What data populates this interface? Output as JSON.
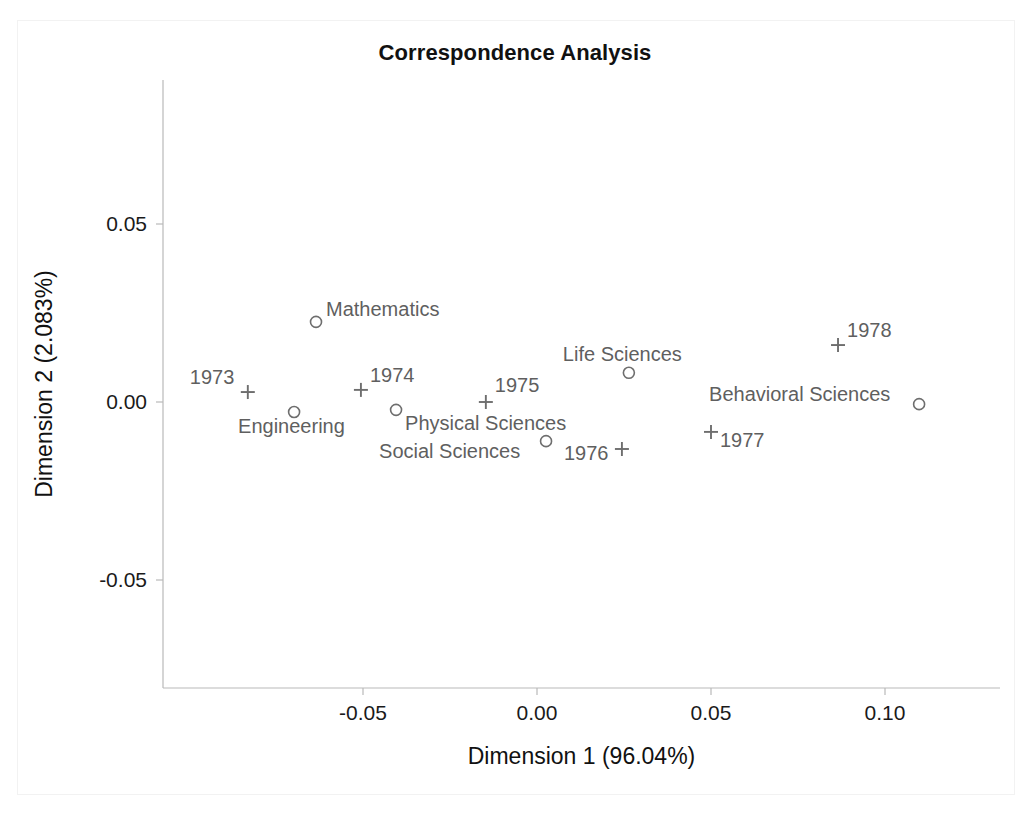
{
  "chart_data": {
    "type": "scatter",
    "title": "Correspondence Analysis",
    "xlabel": "Dimension 1 (96.04%)",
    "ylabel": "Dimension 2 (2.083%)",
    "xlim": [
      -0.092,
      0.125
    ],
    "ylim": [
      -0.072,
      0.058
    ],
    "xticks": [
      -0.05,
      0.0,
      0.05,
      0.1
    ],
    "xtick_labels": [
      "-0.05",
      "0.00",
      "0.05",
      "0.10"
    ],
    "yticks": [
      0.05,
      0.0,
      -0.05
    ],
    "ytick_labels": [
      "0.05",
      "0.00",
      "-0.05"
    ],
    "grid": false,
    "legend": "none",
    "marker_color": "#6e6e6e",
    "label_color": "#5f5f5f",
    "axis_color": "#b9b9b9",
    "series": [
      {
        "name": "Field of study",
        "marker": "circle",
        "points": [
          {
            "label": "Mathematics",
            "x": -0.0635,
            "y": 0.0225,
            "label_dx": 10,
            "label_dy": -6
          },
          {
            "label": "Engineering",
            "x": -0.0698,
            "y": -0.0028,
            "label_dx": -56,
            "label_dy": 21
          },
          {
            "label": "Physical Sciences",
            "x": -0.0405,
            "y": -0.0022,
            "label_dx": 9,
            "label_dy": 20
          },
          {
            "label": "Social Sciences",
            "x": 0.0026,
            "y": -0.011,
            "label_dx": -167,
            "label_dy": 17
          },
          {
            "label": "Life Sciences",
            "x": 0.0264,
            "y": 0.0082,
            "label_dx": -66,
            "label_dy": -12
          },
          {
            "label": "Behavioral Sciences",
            "x": 0.1098,
            "y": -0.0006,
            "label_dx": -210,
            "label_dy": -3
          }
        ]
      },
      {
        "name": "Year",
        "marker": "plus",
        "points": [
          {
            "label": "1973",
            "x": -0.0831,
            "y": 0.0028,
            "label_dx": -58,
            "label_dy": -8
          },
          {
            "label": "1974",
            "x": -0.0506,
            "y": 0.0034,
            "label_dx": 9,
            "label_dy": -8
          },
          {
            "label": "1975",
            "x": -0.0147,
            "y": 0.0,
            "label_dx": 9,
            "label_dy": -10
          },
          {
            "label": "1976",
            "x": 0.0244,
            "y": -0.0132,
            "label_dx": -58,
            "label_dy": 11
          },
          {
            "label": "1977",
            "x": 0.05,
            "y": -0.0084,
            "label_dx": 9,
            "label_dy": 15
          },
          {
            "label": "1978",
            "x": 0.0865,
            "y": 0.016,
            "label_dx": 9,
            "label_dy": -8
          }
        ]
      }
    ]
  },
  "axes_geometry": {
    "x_origin_px": 537,
    "y_origin_px": 402,
    "x_scale_px_per_unit": 3480,
    "y_scale_px_per_unit": 3560,
    "axis_left_px": 163,
    "axis_right_px": 1000,
    "axis_top_px": 80,
    "axis_bottom_px": 688,
    "tick_len_px": 7
  }
}
